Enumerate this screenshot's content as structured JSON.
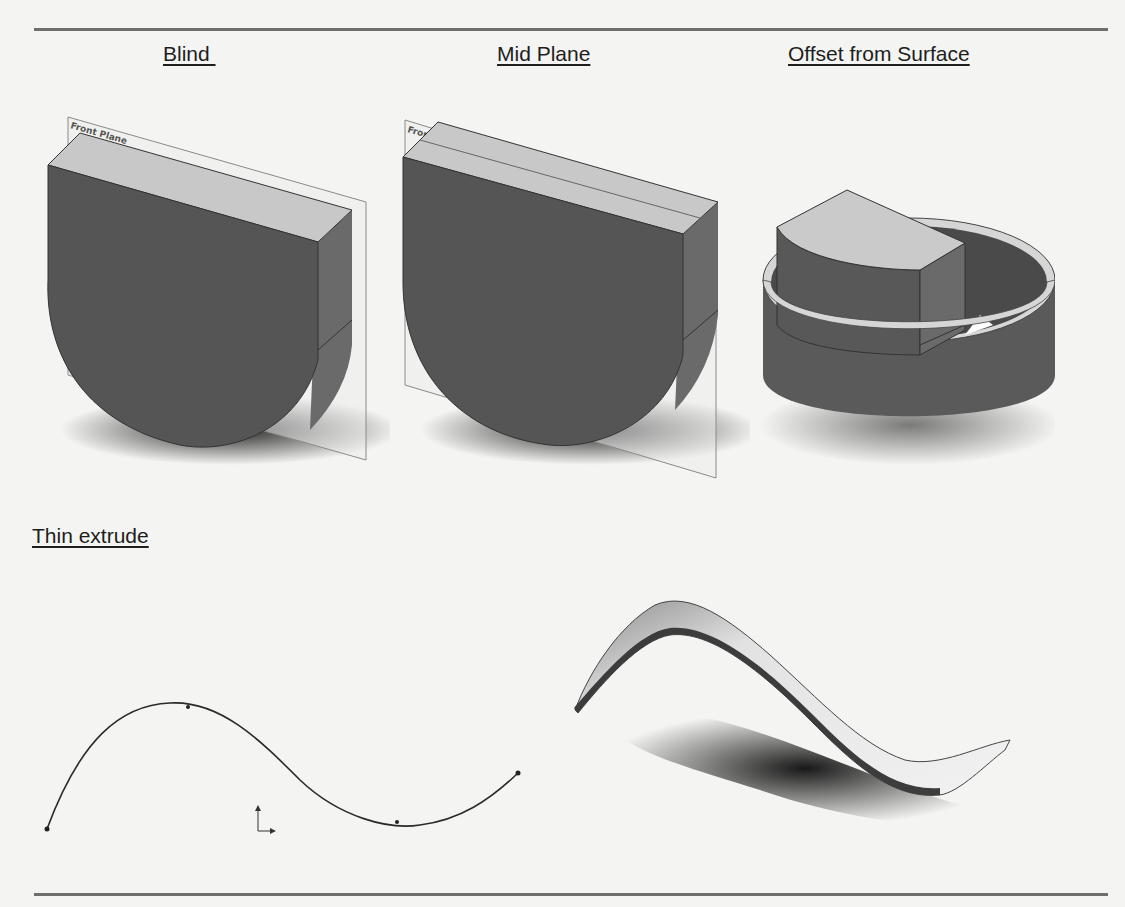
{
  "page": {
    "type": "textbook figure page",
    "colors": {
      "background": "#f4f4f2",
      "rule": "#6e6e6e",
      "solid_face_dark": "#555555",
      "solid_face_top": "#c8c8c8",
      "solid_face_side": "#6a6a6a",
      "plane_outline": "#8a8a8a"
    }
  },
  "headings": {
    "blind": "Blind ",
    "mid_plane": "Mid Plane",
    "offset_from_surface": "Offset from Surface",
    "thin_extrude": "Thin extrude"
  },
  "figures": {
    "blind": {
      "plane_label": "Front Plane",
      "description": "D-shaped extrusion extruded blind from front plane"
    },
    "mid_plane": {
      "plane_label": "Front Plane",
      "description": "D-shaped extrusion centered on front plane"
    },
    "offset_from_surface": {
      "description": "D-shaped extrusion inside cylindrical ring, offset from surface"
    },
    "thin_extrude_sketch": {
      "description": "Open spline sketch with origin marker"
    },
    "thin_extrude_result": {
      "description": "Thin-walled extruded ribbon following spline"
    }
  }
}
